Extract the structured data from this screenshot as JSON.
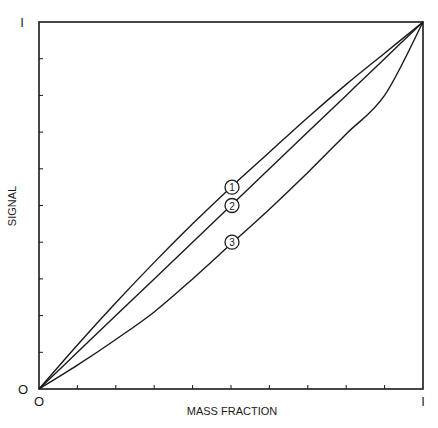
{
  "chart_data": {
    "type": "line",
    "title": "",
    "xlabel": "MASS FRACTION",
    "ylabel": "SIGNAL",
    "xlim": [
      0,
      1
    ],
    "ylim": [
      0,
      1
    ],
    "x_tick_labels": {
      "min": "O",
      "max": "I"
    },
    "y_tick_labels": {
      "min": "O",
      "max": "I"
    },
    "minor_ticks": 10,
    "grid": false,
    "legend": "none (curves labeled inline with circled numbers)",
    "x": [
      0,
      0.1,
      0.2,
      0.3,
      0.4,
      0.5,
      0.6,
      0.7,
      0.8,
      0.9,
      1.0
    ],
    "series": [
      {
        "name": "1",
        "values": [
          0,
          0.12,
          0.235,
          0.345,
          0.45,
          0.55,
          0.645,
          0.74,
          0.83,
          0.915,
          1.0
        ]
      },
      {
        "name": "2",
        "values": [
          0,
          0.1,
          0.2,
          0.3,
          0.4,
          0.5,
          0.6,
          0.7,
          0.8,
          0.9,
          1.0
        ]
      },
      {
        "name": "3",
        "values": [
          0,
          0.065,
          0.135,
          0.21,
          0.3,
          0.395,
          0.49,
          0.59,
          0.695,
          0.8,
          1.0
        ]
      }
    ],
    "annotations": [
      {
        "text": "1",
        "x": 0.5,
        "y": 0.55
      },
      {
        "text": "2",
        "x": 0.5,
        "y": 0.5
      },
      {
        "text": "3",
        "x": 0.5,
        "y": 0.4
      }
    ]
  },
  "axes": {
    "x_label": "MASS FRACTION",
    "y_label": "SIGNAL",
    "x_min_label": "O",
    "x_max_label": "I",
    "y_min_label": "O",
    "y_max_label": "I"
  },
  "colors": {
    "line": "#1a1a1a",
    "background": "#ffffff"
  }
}
